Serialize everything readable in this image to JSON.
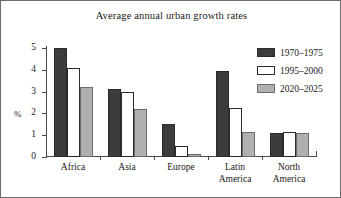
{
  "chart_data": {
    "type": "bar",
    "title": "Average annual urban growth rates",
    "xlabel": "",
    "ylabel": "%",
    "ylim": [
      0,
      5
    ],
    "yticks": [
      0,
      1,
      2,
      3,
      4,
      5
    ],
    "ytick_labels": [
      "0",
      "1",
      "2",
      "3",
      "4",
      "5"
    ],
    "grid": false,
    "legend_position": "top-right",
    "categories": [
      "Africa",
      "Asia",
      "Europe",
      "Latin\nAmerica",
      "North\nAmerica"
    ],
    "series": [
      {
        "name": "1970–1975",
        "color": "#3c3c3c",
        "values": [
          5.0,
          3.1,
          1.5,
          3.95,
          1.08
        ]
      },
      {
        "name": "1995–2000",
        "color": "#ffffff",
        "values": [
          4.1,
          3.0,
          0.5,
          2.25,
          1.15
        ]
      },
      {
        "name": "2020–2025",
        "color": "#b0b0b0",
        "values": [
          3.2,
          2.2,
          0.15,
          1.17,
          1.1
        ]
      }
    ]
  }
}
